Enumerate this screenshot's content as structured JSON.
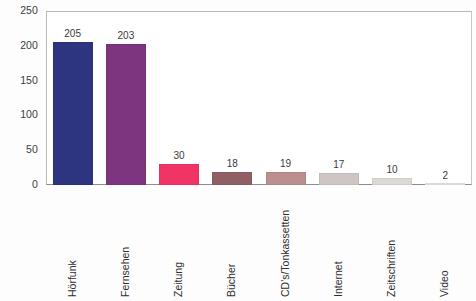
{
  "chart_data": {
    "type": "bar",
    "title": "",
    "subtitle": "",
    "xlabel": "",
    "ylabel": "",
    "categories": [
      "Hörfunk",
      "Fernsehen",
      "Zeitung",
      "Bücher",
      "CD's/Tonkassetten",
      "Internet",
      "Zeitschriften",
      "Video"
    ],
    "values": [
      205,
      203,
      30,
      18,
      19,
      17,
      10,
      2
    ],
    "value_labels": [
      "205",
      "203",
      "30",
      "18",
      "19",
      "17",
      "10",
      "2"
    ],
    "bar_colors": [
      "#2d3580",
      "#7d3580",
      "#f23465",
      "#8f5f63",
      "#bc8e8e",
      "#cdc6c4",
      "#ddd9d5",
      "#e9e6e2"
    ],
    "ylim": [
      0,
      250
    ],
    "yticks": [
      0,
      50,
      100,
      150,
      200,
      250
    ],
    "ytick_labels": [
      "0",
      "50",
      "100",
      "150",
      "200",
      "250"
    ],
    "grid": false,
    "legend": "none",
    "frame_color": "#b9b9b9",
    "axis_color": "#8e8e8e",
    "text_color": "#3a3a3a",
    "background": "#ffffff"
  }
}
